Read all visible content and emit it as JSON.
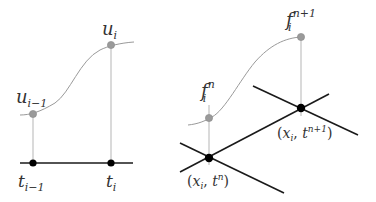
{
  "left_panel": {
    "labels": {
      "u_prev": "u",
      "u_prev_sub": "i−1",
      "u_cur": "u",
      "u_cur_sub": "i",
      "t_prev": "t",
      "t_prev_sub": "i−1",
      "t_cur": "t",
      "t_cur_sub": "i"
    }
  },
  "right_panel": {
    "labels": {
      "f_n": "f",
      "f_n_sub": "i",
      "f_n_sup": "n",
      "f_np1": "f",
      "f_np1_sub": "i",
      "f_np1_sup": "n+1",
      "node_n_open": "(",
      "node_n_x": "x",
      "node_n_xsub": "i",
      "node_n_comma": ", ",
      "node_n_t": "t",
      "node_n_tsup": "n",
      "node_n_close": ")",
      "node_np1_open": "(",
      "node_np1_x": "x",
      "node_np1_xsub": "i",
      "node_np1_comma": ", ",
      "node_np1_t": "t",
      "node_np1_tsup": "n+1",
      "node_np1_close": ")"
    }
  },
  "colors": {
    "axis": "#1a1a1a",
    "node": "#000000",
    "value_point": "#9a9a9a",
    "curve": "#9a9a9a",
    "stem": "#b5b5b5",
    "text": "#333333"
  }
}
